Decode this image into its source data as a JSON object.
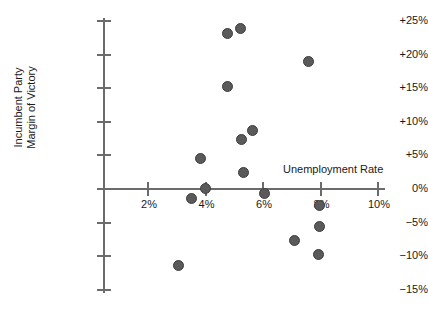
{
  "chart_data": {
    "type": "scatter",
    "title": "",
    "xlabel": "Unemployment Rate",
    "ylabel": "Incumbent Party Margin of Victory",
    "ylabel_line1": "Incumbent Party",
    "ylabel_line2": "Margin of Victory",
    "xlim": [
      1.0,
      10.0
    ],
    "ylim": [
      -15,
      25
    ],
    "grid": false,
    "legend": null,
    "marker_color": "#5a5a5a",
    "marker_edge_color": "#3d3d3d",
    "axis_color": "#6b6b6b",
    "xticks": [
      2,
      4,
      6,
      8,
      10
    ],
    "xtick_labels": [
      "2%",
      "4%",
      "6%",
      "8%",
      "10%"
    ],
    "yticks": [
      25,
      20,
      15,
      10,
      5,
      0,
      -5,
      -10,
      -15
    ],
    "ytick_labels": [
      "+25%",
      "+20%",
      "+15%",
      "+10%",
      "+5%",
      "0%",
      "−5%",
      "−10%",
      "−15%"
    ],
    "points": [
      {
        "x": 4.77,
        "y": 23.1
      },
      {
        "x": 5.23,
        "y": 23.9
      },
      {
        "x": 7.57,
        "y": 19.0
      },
      {
        "x": 4.75,
        "y": 15.2
      },
      {
        "x": 5.64,
        "y": 8.7
      },
      {
        "x": 5.25,
        "y": 7.4
      },
      {
        "x": 3.82,
        "y": 4.5
      },
      {
        "x": 5.33,
        "y": 2.4
      },
      {
        "x": 4.0,
        "y": 0.1
      },
      {
        "x": 6.04,
        "y": -0.6
      },
      {
        "x": 3.52,
        "y": -1.4
      },
      {
        "x": 7.96,
        "y": -2.4
      },
      {
        "x": 7.95,
        "y": -5.6
      },
      {
        "x": 7.1,
        "y": -7.7
      },
      {
        "x": 7.93,
        "y": -9.7
      },
      {
        "x": 3.05,
        "y": -11.4
      }
    ]
  }
}
